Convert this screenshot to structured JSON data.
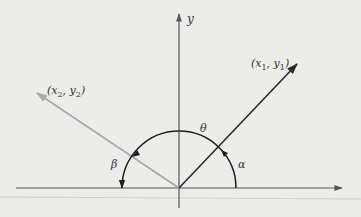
{
  "diagram": {
    "type": "vector-angle-diagram",
    "axes": {
      "y_label": "y"
    },
    "vectors": [
      {
        "name": "vector-1",
        "label_x": "x",
        "label_x_sub": "1",
        "label_y": "y",
        "label_y_sub": "1",
        "color": "#2a2a2a"
      },
      {
        "name": "vector-2",
        "label_x": "x",
        "label_x_sub": "2",
        "label_y": "y",
        "label_y_sub": "2",
        "color": "#a8a8a8"
      }
    ],
    "angles": {
      "theta": "θ",
      "alpha": "α",
      "beta": "β"
    },
    "colors": {
      "background": "#ececea",
      "axis": "#555555",
      "vector_dark": "#2a2a2a",
      "vector_light": "#a8a8a8",
      "arc": "#1e1e1e"
    }
  }
}
